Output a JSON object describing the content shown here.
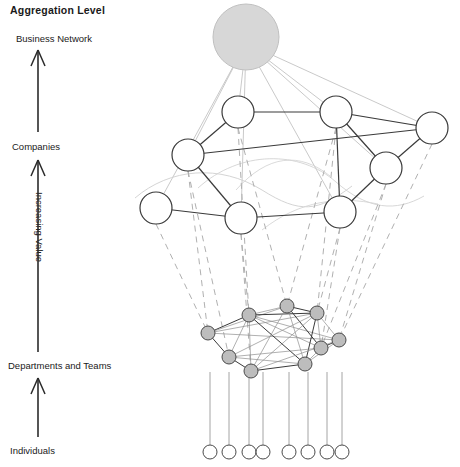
{
  "figure": {
    "title": "Aggregation Level",
    "axis": {
      "vertical_label": "Increasing Value",
      "levels": [
        {
          "id": "business-network",
          "label": "Business Network",
          "y": 40
        },
        {
          "id": "companies",
          "label": "Companies",
          "y": 148
        },
        {
          "id": "departments-teams",
          "label": "Departments  and Teams",
          "y": 367
        },
        {
          "id": "individuals",
          "label": "Individuals",
          "y": 452
        }
      ]
    },
    "cloud": {
      "label": "Network",
      "cx": 246,
      "cy": 37,
      "r": 33,
      "fill": "#d7d7d7"
    },
    "colors": {
      "ink": "#2b2b2b",
      "edge_strong": "#3a3a3a",
      "edge_faint": "#c3c3c3",
      "edge_dashed": "#b0b0b0",
      "node_fill_white": "#ffffff",
      "node_fill_gray": "#bdbdbd",
      "text": "#1a1a1a"
    },
    "layers": {
      "companies": {
        "name": "Companies",
        "node_radius": 16,
        "nodes": [
          {
            "id": "c1",
            "cx": 238,
            "cy": 112
          },
          {
            "id": "c2",
            "cx": 336,
            "cy": 112
          },
          {
            "id": "c3",
            "cx": 432,
            "cy": 128
          },
          {
            "id": "c4",
            "cx": 188,
            "cy": 155
          },
          {
            "id": "c5",
            "cx": 386,
            "cy": 168
          },
          {
            "id": "c6",
            "cx": 156,
            "cy": 208
          },
          {
            "id": "c7",
            "cx": 241,
            "cy": 218
          },
          {
            "id": "c8",
            "cx": 340,
            "cy": 212
          }
        ],
        "edges": [
          [
            "c1",
            "c2"
          ],
          [
            "c1",
            "c4"
          ],
          [
            "c2",
            "c3"
          ],
          [
            "c2",
            "c5"
          ],
          [
            "c3",
            "c5"
          ],
          [
            "c4",
            "c3"
          ],
          [
            "c4",
            "c7"
          ],
          [
            "c5",
            "c8"
          ],
          [
            "c6",
            "c7"
          ],
          [
            "c7",
            "c8"
          ],
          [
            "c2",
            "c8"
          ]
        ]
      },
      "departments": {
        "name": "Departments and Teams",
        "node_radius": 7,
        "nodes": [
          {
            "id": "d1",
            "cx": 208,
            "cy": 333
          },
          {
            "id": "d2",
            "cx": 249,
            "cy": 315
          },
          {
            "id": "d3",
            "cx": 287,
            "cy": 306
          },
          {
            "id": "d4",
            "cx": 317,
            "cy": 313
          },
          {
            "id": "d5",
            "cx": 339,
            "cy": 340
          },
          {
            "id": "d6",
            "cx": 229,
            "cy": 357
          },
          {
            "id": "d7",
            "cx": 251,
            "cy": 371
          },
          {
            "id": "d8",
            "cx": 305,
            "cy": 364
          },
          {
            "id": "d9",
            "cx": 321,
            "cy": 348
          }
        ],
        "edges": [
          [
            "d1",
            "d2"
          ],
          [
            "d1",
            "d3"
          ],
          [
            "d1",
            "d4"
          ],
          [
            "d1",
            "d6"
          ],
          [
            "d1",
            "d5"
          ],
          [
            "d2",
            "d3"
          ],
          [
            "d2",
            "d4"
          ],
          [
            "d2",
            "d6"
          ],
          [
            "d2",
            "d7"
          ],
          [
            "d2",
            "d8"
          ],
          [
            "d2",
            "d9"
          ],
          [
            "d2",
            "d5"
          ],
          [
            "d3",
            "d4"
          ],
          [
            "d3",
            "d7"
          ],
          [
            "d3",
            "d8"
          ],
          [
            "d3",
            "d9"
          ],
          [
            "d4",
            "d5"
          ],
          [
            "d4",
            "d7"
          ],
          [
            "d4",
            "d8"
          ],
          [
            "d4",
            "d9"
          ],
          [
            "d4",
            "d6"
          ],
          [
            "d5",
            "d9"
          ],
          [
            "d5",
            "d8"
          ],
          [
            "d5",
            "d7"
          ],
          [
            "d6",
            "d7"
          ],
          [
            "d6",
            "d9"
          ],
          [
            "d6",
            "d8"
          ],
          [
            "d7",
            "d8"
          ],
          [
            "d8",
            "d9"
          ]
        ]
      },
      "individuals": {
        "name": "Individuals",
        "node_radius": 7,
        "stem_top": 372,
        "nodes": [
          {
            "id": "i1",
            "cx": 210,
            "cy": 452
          },
          {
            "id": "i2",
            "cx": 229,
            "cy": 452
          },
          {
            "id": "i3",
            "cx": 249,
            "cy": 452
          },
          {
            "id": "i4",
            "cx": 263,
            "cy": 452
          },
          {
            "id": "i5",
            "cx": 289,
            "cy": 452
          },
          {
            "id": "i6",
            "cx": 308,
            "cy": 452
          },
          {
            "id": "i7",
            "cx": 327,
            "cy": 452
          },
          {
            "id": "i8",
            "cx": 342,
            "cy": 452
          }
        ]
      }
    },
    "cloud_links": [
      {
        "to": "c1"
      },
      {
        "to": "c2"
      },
      {
        "to": "c3"
      },
      {
        "to": "c4"
      },
      {
        "to": "c5"
      },
      {
        "to": "c6"
      },
      {
        "to": "c7"
      },
      {
        "to": "c8"
      }
    ],
    "company_to_department_links": [
      {
        "from": "c4",
        "to": "d1"
      },
      {
        "from": "c4",
        "to": "d6"
      },
      {
        "from": "c7",
        "to": "d2"
      },
      {
        "from": "c7",
        "to": "d7"
      },
      {
        "from": "c1",
        "to": "d2"
      },
      {
        "from": "c1",
        "to": "d3"
      },
      {
        "from": "c2",
        "to": "d3"
      },
      {
        "from": "c2",
        "to": "d4"
      },
      {
        "from": "c8",
        "to": "d4"
      },
      {
        "from": "c8",
        "to": "d9"
      },
      {
        "from": "c5",
        "to": "d5"
      },
      {
        "from": "c5",
        "to": "d9"
      },
      {
        "from": "c3",
        "to": "d5"
      },
      {
        "from": "c6",
        "to": "d1"
      }
    ]
  }
}
